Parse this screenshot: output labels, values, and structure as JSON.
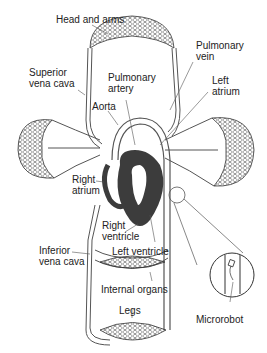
{
  "diagram": {
    "colors": {
      "vessel": "#555555",
      "heart": "#3c3c3c",
      "text": "#222222",
      "background": "#ffffff"
    },
    "labels": {
      "head_and_arms": "Head and arms",
      "superior_vena_cava": "Superior\nvena cava",
      "pulmonary_vein": "Pulmonary\nvein",
      "pulmonary_artery": "Pulmonary\nartery",
      "left_atrium": "Left\natrium",
      "aorta": "Aorta",
      "right_atrium": "Right\natrium",
      "right_ventricle": "Right\nventricle",
      "inferior_vena_cava": "Inferior\nvena cava",
      "left_ventricle": "Left ventricle",
      "internal_organs": "Internal organs",
      "legs": "Legs",
      "microrobot": "Microrobot"
    }
  }
}
